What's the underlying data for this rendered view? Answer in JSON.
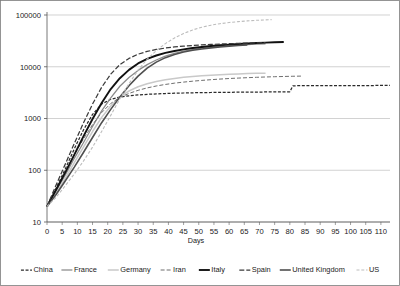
{
  "chart_data": {
    "type": "line",
    "title": "",
    "xlabel": "Days",
    "ylabel": "",
    "yscale": "log",
    "ylim": [
      10,
      100000
    ],
    "xlim": [
      0,
      113
    ],
    "grid": "horizontal",
    "legend_position": "bottom",
    "ytick_labels": [
      "100000",
      "10000",
      "1000",
      "100",
      "10"
    ],
    "ytick_values": [
      100000,
      10000,
      1000,
      100,
      10
    ],
    "xtick_labels": [
      "0",
      "5",
      "10",
      "15",
      "20",
      "25",
      "30",
      "35",
      "40",
      "45",
      "50",
      "55",
      "60",
      "65",
      "70",
      "75",
      "80",
      "85",
      "90",
      "95",
      "100",
      "105",
      "110"
    ],
    "xtick_values": [
      0,
      5,
      10,
      15,
      20,
      25,
      30,
      35,
      40,
      45,
      50,
      55,
      60,
      65,
      70,
      75,
      80,
      85,
      90,
      95,
      100,
      105,
      110
    ],
    "series": [
      {
        "name": "China",
        "color": "#2b2b2b",
        "width": 1.25,
        "dash": "3,1.6",
        "x": [
          0,
          3,
          6,
          9,
          12,
          15,
          18,
          21,
          24,
          27,
          30,
          33,
          36,
          39,
          42,
          45,
          48,
          51,
          54,
          57,
          60,
          63,
          66,
          69,
          72,
          75,
          78,
          79,
          80,
          81,
          84,
          87,
          90,
          93,
          96,
          99,
          102,
          105,
          108,
          111,
          113
        ],
        "y": [
          20,
          45,
          105,
          260,
          600,
          1200,
          1900,
          2350,
          2600,
          2750,
          2850,
          2930,
          2990,
          3040,
          3080,
          3110,
          3140,
          3160,
          3180,
          3195,
          3210,
          3225,
          3235,
          3245,
          3255,
          3265,
          3275,
          3280,
          3285,
          4290,
          4300,
          4310,
          4315,
          4320,
          4325,
          4330,
          4335,
          4340,
          4342,
          4345,
          4346
        ]
      },
      {
        "name": "France",
        "color": "#8a8a8a",
        "width": 1.25,
        "dash": "none",
        "x": [
          0,
          3,
          6,
          9,
          12,
          15,
          18,
          21,
          24,
          27,
          30,
          33,
          36,
          39,
          42,
          45,
          48,
          51,
          54,
          57,
          60,
          63,
          66,
          69,
          72
        ],
        "y": [
          20,
          40,
          80,
          170,
          340,
          700,
          1400,
          2500,
          4200,
          6200,
          8500,
          11000,
          13500,
          16000,
          18200,
          20000,
          21500,
          22800,
          23900,
          24800,
          25600,
          26300,
          26900,
          27400,
          27800
        ]
      },
      {
        "name": "Germany",
        "color": "#c9c9c9",
        "width": 1.5,
        "dash": "none",
        "x": [
          0,
          3,
          6,
          9,
          12,
          15,
          18,
          21,
          24,
          27,
          30,
          33,
          36,
          39,
          42,
          45,
          48,
          51,
          54,
          57,
          60,
          63,
          66,
          69,
          72
        ],
        "y": [
          20,
          36,
          70,
          140,
          280,
          560,
          1050,
          1750,
          2600,
          3400,
          4100,
          4700,
          5200,
          5600,
          5950,
          6250,
          6500,
          6700,
          6880,
          7030,
          7160,
          7270,
          7370,
          7450,
          7520
        ]
      },
      {
        "name": "Iran",
        "color": "#6f6f6f",
        "width": 1.0,
        "dash": "4,2",
        "x": [
          0,
          3,
          6,
          9,
          12,
          15,
          18,
          21,
          24,
          27,
          30,
          33,
          36,
          39,
          42,
          45,
          48,
          51,
          54,
          57,
          60,
          63,
          66,
          69,
          72,
          75,
          78,
          81,
          84
        ],
        "y": [
          20,
          44,
          95,
          200,
          400,
          760,
          1300,
          1950,
          2550,
          3050,
          3500,
          3900,
          4250,
          4550,
          4820,
          5050,
          5260,
          5450,
          5620,
          5780,
          5920,
          6040,
          6150,
          6250,
          6340,
          6420,
          6490,
          6550,
          6600
        ]
      },
      {
        "name": "Italy",
        "color": "#111111",
        "width": 1.9,
        "dash": "none",
        "x": [
          0,
          3,
          6,
          9,
          12,
          15,
          18,
          21,
          24,
          27,
          30,
          33,
          36,
          39,
          42,
          45,
          48,
          51,
          54,
          57,
          60,
          63,
          66,
          69,
          72,
          75,
          78
        ],
        "y": [
          20,
          42,
          90,
          200,
          450,
          980,
          2000,
          3700,
          6000,
          8700,
          11600,
          14200,
          16500,
          18500,
          20200,
          21700,
          23000,
          24100,
          25100,
          26000,
          26800,
          27500,
          28100,
          28700,
          29200,
          29700,
          30100
        ]
      },
      {
        "name": "Spain",
        "color": "#3a3a3a",
        "width": 1.25,
        "dash": "5,2",
        "x": [
          0,
          3,
          6,
          9,
          12,
          15,
          18,
          21,
          24,
          27,
          30,
          33,
          36,
          39,
          42,
          45,
          48,
          51,
          54,
          57,
          60,
          63,
          66,
          69,
          72
        ],
        "y": [
          20,
          52,
          130,
          330,
          820,
          1900,
          4000,
          7200,
          11000,
          14500,
          17500,
          19800,
          21600,
          23000,
          24100,
          25000,
          25800,
          26400,
          27000,
          27500,
          27900,
          28300,
          28650,
          28950,
          29200
        ]
      },
      {
        "name": "United Kingdom",
        "color": "#4f4f4f",
        "width": 1.6,
        "dash": "none",
        "x": [
          0,
          3,
          6,
          9,
          12,
          15,
          18,
          21,
          24,
          27,
          30,
          33,
          36,
          39,
          42,
          45,
          48,
          51,
          54,
          57,
          60,
          63,
          66
        ],
        "y": [
          20,
          34,
          62,
          115,
          220,
          430,
          830,
          1500,
          2600,
          4300,
          6600,
          9400,
          12300,
          15000,
          17300,
          19200,
          20800,
          22100,
          23200,
          24200,
          25000,
          25700,
          26300
        ]
      },
      {
        "name": "US",
        "color": "#bdbdbd",
        "width": 1.1,
        "dash": "3,1.8",
        "x": [
          0,
          3,
          6,
          9,
          12,
          15,
          18,
          21,
          24,
          27,
          30,
          33,
          36,
          39,
          42,
          45,
          48,
          51,
          54,
          57,
          60,
          63,
          66,
          69,
          72,
          74
        ],
        "y": [
          20,
          30,
          50,
          85,
          150,
          280,
          560,
          1150,
          2400,
          4700,
          8600,
          14000,
          20500,
          28000,
          36000,
          44000,
          51500,
          58000,
          63500,
          68000,
          71500,
          74500,
          77000,
          79000,
          80500,
          81500
        ]
      }
    ]
  },
  "axis": {
    "x_title": "Days"
  },
  "legend": {
    "items": [
      {
        "label": "China"
      },
      {
        "label": "France"
      },
      {
        "label": "Germany"
      },
      {
        "label": "Iran"
      },
      {
        "label": "Italy"
      },
      {
        "label": "Spain"
      },
      {
        "label": "United Kingdom"
      },
      {
        "label": "US"
      }
    ]
  }
}
